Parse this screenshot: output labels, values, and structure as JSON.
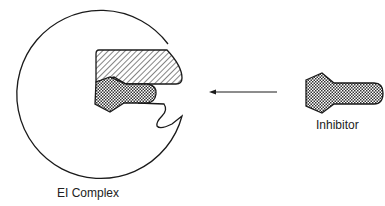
{
  "diagram": {
    "enzyme_label": "EI Complex",
    "inhibitor_label": "Inhibitor",
    "arrow": {
      "direction": "left"
    },
    "colors": {
      "stroke": "#1a1a1a",
      "background": "#ffffff",
      "checker": "#333333",
      "hatch": "#333333"
    }
  }
}
